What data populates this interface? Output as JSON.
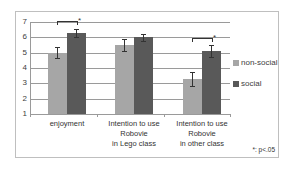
{
  "chart_data": {
    "type": "bar",
    "title": "",
    "xlabel": "",
    "ylabel": "",
    "ylim": [
      1,
      7
    ],
    "yticks": [
      1,
      2,
      3,
      4,
      5,
      6,
      7
    ],
    "grid": true,
    "legend_position": "right",
    "categories": [
      "enjoyment",
      "Intention to use Robovie in Lego class",
      "Intention to use Robovie in other class"
    ],
    "category_label_lines": [
      [
        "enjoyment"
      ],
      [
        "Intention to use",
        "Robovie",
        "in Lego class"
      ],
      [
        "Intention to use",
        "Robovie",
        "in other class"
      ]
    ],
    "series": [
      {
        "name": "non-social",
        "color": "#a6a6a6",
        "values": [
          5.0,
          5.5,
          3.3
        ],
        "errors": [
          0.35,
          0.4,
          0.45
        ]
      },
      {
        "name": "social",
        "color": "#595959",
        "values": [
          6.3,
          6.0,
          5.1
        ],
        "errors": [
          0.25,
          0.25,
          0.4
        ]
      }
    ],
    "annotations": [
      {
        "type": "significance",
        "category": "enjoyment",
        "label": "*"
      },
      {
        "type": "significance",
        "category": "Intention to use Robovie in other class",
        "label": "*"
      }
    ],
    "note": "*: p<.05"
  }
}
